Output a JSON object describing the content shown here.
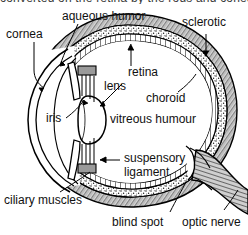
{
  "figure": {
    "title_cutoff": "converted on the retina by the rods and cones",
    "background": "#ffffff",
    "ink": "#000000"
  },
  "labels": {
    "aqueous_humor": "aqueous humor",
    "cornea": "cornea",
    "sclerotic": "sclerotic",
    "retina": "retina",
    "choroid": "choroid",
    "lens": "lens",
    "iris": "iris",
    "vitreous_humour": "vitreous humour",
    "suspensory_ligament_line1": "suspensory",
    "suspensory_ligament_line2": "ligament",
    "ciliary_muscles": "ciliary muscles",
    "blind_spot": "blind spot",
    "optic_nerve": "optic nerve"
  },
  "layers": {
    "outer": "sclerotic",
    "middle": "choroid",
    "inner": "retina"
  },
  "colors": {
    "sclerotic_fill": "#bfbfbf",
    "choroid_fill": "#efefef",
    "retina_fill": "#ffffff",
    "stroke": "#000000"
  }
}
